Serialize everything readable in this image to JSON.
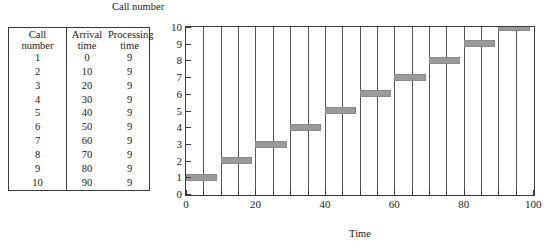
{
  "table": {
    "headers": {
      "call": {
        "line1": "Call",
        "line2": "number"
      },
      "arrival": {
        "line1": "Arrival",
        "line2": "time"
      },
      "processing": {
        "line1": "Processing",
        "line2": "time"
      }
    },
    "rows": [
      {
        "call": "1",
        "arrival": "0",
        "processing": "9"
      },
      {
        "call": "2",
        "arrival": "10",
        "processing": "9"
      },
      {
        "call": "3",
        "arrival": "20",
        "processing": "9"
      },
      {
        "call": "4",
        "arrival": "30",
        "processing": "9"
      },
      {
        "call": "5",
        "arrival": "40",
        "processing": "9"
      },
      {
        "call": "6",
        "arrival": "50",
        "processing": "9"
      },
      {
        "call": "7",
        "arrival": "60",
        "processing": "9"
      },
      {
        "call": "8",
        "arrival": "70",
        "processing": "9"
      },
      {
        "call": "9",
        "arrival": "80",
        "processing": "9"
      },
      {
        "call": "10",
        "arrival": "90",
        "processing": "9"
      }
    ]
  },
  "chart_data": {
    "type": "bar",
    "title": "Call number",
    "xlabel": "Time",
    "ylabel": "Call number",
    "xlim": [
      0,
      100
    ],
    "ylim": [
      0,
      10
    ],
    "grid": true,
    "grid_axis": "x",
    "grid_interval": 5,
    "x_ticks": [
      0,
      5,
      10,
      15,
      20,
      25,
      30,
      35,
      40,
      45,
      50,
      55,
      60,
      65,
      70,
      75,
      80,
      85,
      90,
      95,
      100
    ],
    "x_tick_labels": [
      {
        "value": 0,
        "label": "0"
      },
      {
        "value": 20,
        "label": "20"
      },
      {
        "value": 40,
        "label": "40"
      },
      {
        "value": 60,
        "label": "60"
      },
      {
        "value": 80,
        "label": "80"
      },
      {
        "value": 100,
        "label": "100"
      }
    ],
    "y_ticks": [
      0,
      1,
      2,
      3,
      4,
      5,
      6,
      7,
      8,
      9,
      10
    ],
    "y_tick_labels": [
      "0",
      "1",
      "2",
      "3",
      "4",
      "5",
      "6",
      "7",
      "8",
      "9",
      "10"
    ],
    "bar_color": "#9a9a9a",
    "series": [
      {
        "name": "Call service intervals",
        "bars": [
          {
            "call": 1,
            "start": 0,
            "duration": 9,
            "end": 9
          },
          {
            "call": 2,
            "start": 10,
            "duration": 9,
            "end": 19
          },
          {
            "call": 3,
            "start": 20,
            "duration": 9,
            "end": 29
          },
          {
            "call": 4,
            "start": 30,
            "duration": 9,
            "end": 39
          },
          {
            "call": 5,
            "start": 40,
            "duration": 9,
            "end": 49
          },
          {
            "call": 6,
            "start": 50,
            "duration": 9,
            "end": 59
          },
          {
            "call": 7,
            "start": 60,
            "duration": 9,
            "end": 69
          },
          {
            "call": 8,
            "start": 70,
            "duration": 9,
            "end": 79
          },
          {
            "call": 9,
            "start": 80,
            "duration": 9,
            "end": 89
          },
          {
            "call": 10,
            "start": 90,
            "duration": 9,
            "end": 99
          }
        ]
      }
    ]
  }
}
